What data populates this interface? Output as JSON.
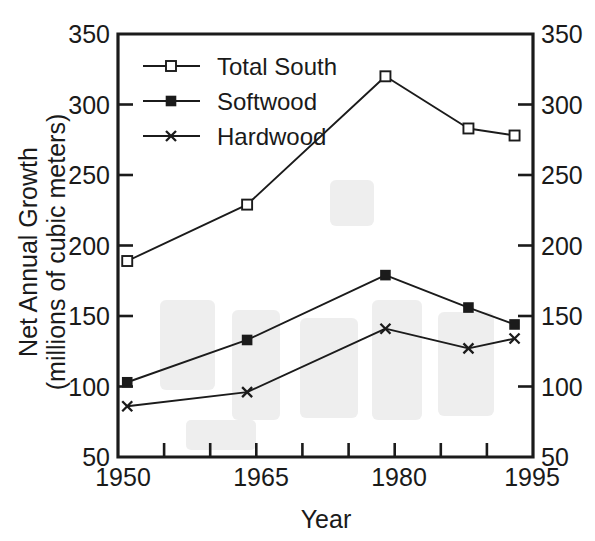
{
  "chart_data": {
    "type": "line",
    "title": "",
    "xlabel": "Year",
    "ylabel": "Net Annual Growth (millions of cubic meters)",
    "ylabel_line1": "Net Annual Growth",
    "ylabel_line2": "(millions of cubic meters)",
    "xlim": [
      1950,
      1995
    ],
    "ylim": [
      50,
      350
    ],
    "xticks": [
      1950,
      1955,
      1960,
      1965,
      1970,
      1975,
      1980,
      1985,
      1990,
      1995
    ],
    "xticklabels": [
      "1950",
      "",
      "",
      "1965",
      "",
      "",
      "1980",
      "",
      "",
      "1995"
    ],
    "xticklabels_shown": [
      "1950",
      "1965",
      "1980",
      "1995"
    ],
    "yticks": [
      50,
      100,
      150,
      200,
      250,
      300,
      350
    ],
    "yticklabels": [
      "50",
      "100",
      "150",
      "200",
      "250",
      "300",
      "350"
    ],
    "y_axis_right_labels": [
      "50",
      "100",
      "150",
      "200",
      "250",
      "300",
      "350"
    ],
    "grid": false,
    "legend_position": "upper left inside",
    "x": [
      1951,
      1964,
      1979,
      1988,
      1993
    ],
    "series": [
      {
        "name": "Total South",
        "marker": "open-square",
        "values": [
          189,
          229,
          320,
          283,
          278
        ]
      },
      {
        "name": "Softwood",
        "marker": "filled-square",
        "values": [
          103,
          133,
          179,
          156,
          144
        ]
      },
      {
        "name": "Hardwood",
        "marker": "cross",
        "values": [
          86,
          96,
          141,
          127,
          134
        ]
      }
    ]
  },
  "legend": {
    "items": [
      {
        "label": "Total South",
        "marker": "open-square"
      },
      {
        "label": "Softwood",
        "marker": "filled-square"
      },
      {
        "label": "Hardwood",
        "marker": "cross"
      }
    ]
  },
  "axes": {
    "x_title": "Year",
    "y_title_line1": "Net Annual Growth",
    "y_title_line2": "(millions of cubic meters)"
  },
  "colors": {
    "ink": "#1b1b1b",
    "background": "#ffffff",
    "marker_fill_open": "#ffffff",
    "marker_fill_solid": "#1b1b1b"
  }
}
